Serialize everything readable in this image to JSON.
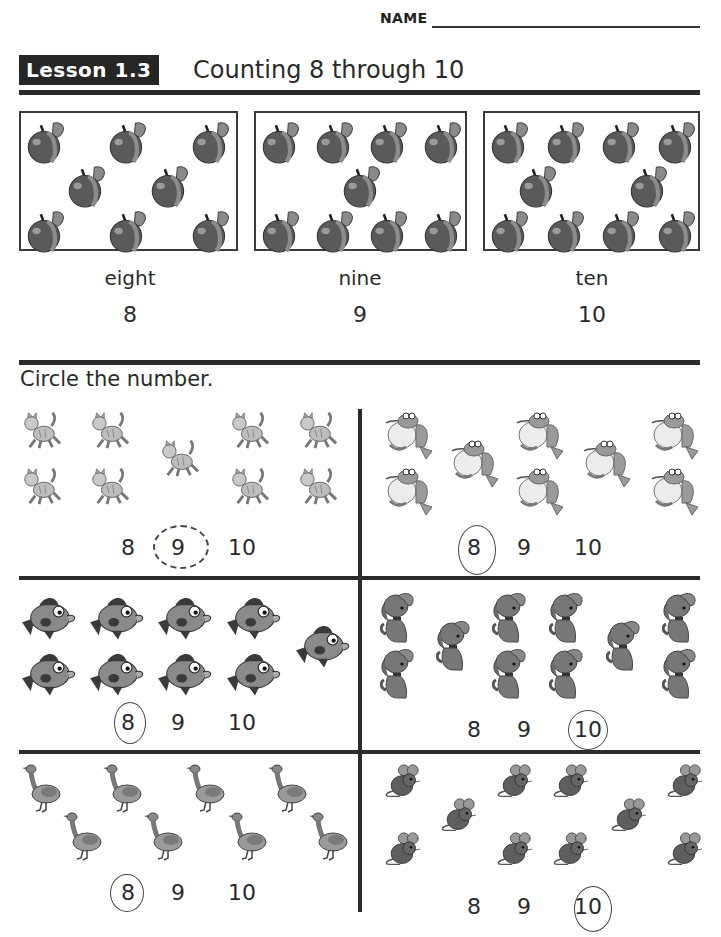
{
  "header": {
    "name_label": "NAME",
    "lesson_badge": "Lesson 1.3",
    "lesson_title": "Counting 8 through 10"
  },
  "examples": [
    {
      "word": "eight",
      "number": "8",
      "count": 8,
      "icon": "apple-icon"
    },
    {
      "word": "nine",
      "number": "9",
      "count": 9,
      "icon": "apple-icon"
    },
    {
      "word": "ten",
      "number": "10",
      "count": 10,
      "icon": "apple-icon"
    }
  ],
  "instruction": "Circle the number.",
  "exercises": [
    {
      "animal": "cat",
      "icon": "cat-icon",
      "count": 9,
      "choices": [
        "8",
        "9",
        "10"
      ],
      "circled": "9"
    },
    {
      "animal": "frog",
      "icon": "frog-icon",
      "count": 8,
      "choices": [
        "8",
        "9",
        "10"
      ],
      "circled": "8"
    },
    {
      "animal": "fish",
      "icon": "fish-icon",
      "count": 9,
      "choices": [
        "8",
        "9",
        "10"
      ],
      "circled": "8"
    },
    {
      "animal": "dog",
      "icon": "dog-icon",
      "count": 10,
      "choices": [
        "8",
        "9",
        "10"
      ],
      "circled": "10"
    },
    {
      "animal": "goose",
      "icon": "goose-icon",
      "count": 8,
      "choices": [
        "8",
        "9",
        "10"
      ],
      "circled": "8"
    },
    {
      "animal": "mouse",
      "icon": "mouse-icon",
      "count": 10,
      "choices": [
        "8",
        "9",
        "10"
      ],
      "circled": "10"
    }
  ],
  "colors": {
    "ink": "#2b2b2b",
    "badge_bg": "#262626",
    "badge_text": "#ffffff",
    "pencil": "#444444"
  }
}
